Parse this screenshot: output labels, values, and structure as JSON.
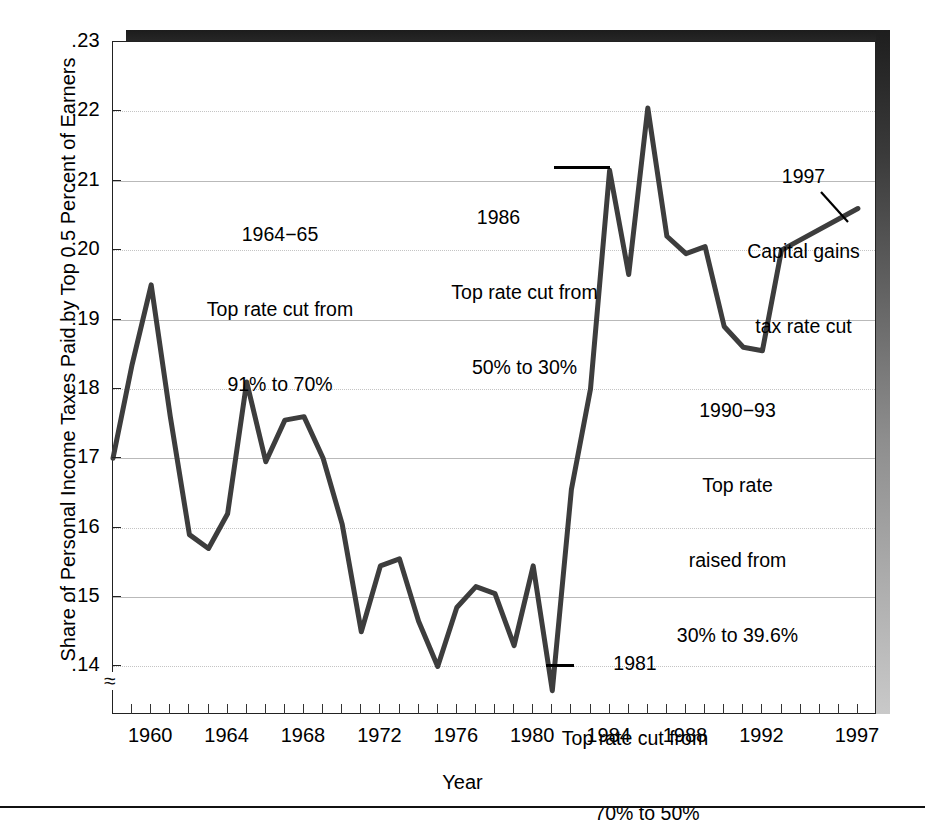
{
  "chart_data": {
    "type": "line",
    "title": "",
    "xlabel": "Year",
    "ylabel": "Share of Personal Income Taxes Paid by Top 0.5 Percent of Earners",
    "xlim": [
      1958,
      1998
    ],
    "ylim": [
      0.133,
      0.23
    ],
    "grid": true,
    "legend": "none",
    "y_ticks": [
      ".14",
      ".15",
      ".16",
      ".17",
      ".18",
      ".19",
      ".20",
      ".21",
      ".22",
      ".23"
    ],
    "y_tick_values": [
      0.14,
      0.15,
      0.16,
      0.17,
      0.18,
      0.19,
      0.2,
      0.21,
      0.22,
      0.23
    ],
    "x_ticks": [
      "1960",
      "1964",
      "1968",
      "1972",
      "1976",
      "1980",
      "1984",
      "1988",
      "1992",
      "1997"
    ],
    "x_tick_values": [
      1960,
      1964,
      1968,
      1972,
      1976,
      1980,
      1984,
      1988,
      1992,
      1997
    ],
    "axis_break_symbol": "≈",
    "series": [
      {
        "name": "Share of personal income taxes paid by top 0.5% of earners",
        "x": [
          1958,
          1959,
          1960,
          1961,
          1962,
          1963,
          1964,
          1965,
          1966,
          1967,
          1968,
          1969,
          1970,
          1971,
          1972,
          1973,
          1974,
          1975,
          1976,
          1977,
          1978,
          1979,
          1980,
          1981,
          1982,
          1983,
          1984,
          1985,
          1986,
          1987,
          1988,
          1989,
          1990,
          1991,
          1992,
          1993,
          1997
        ],
        "values": [
          0.17,
          0.1835,
          0.195,
          0.176,
          0.159,
          0.157,
          0.162,
          0.181,
          0.1695,
          0.1755,
          0.176,
          0.17,
          0.1605,
          0.145,
          0.1545,
          0.1555,
          0.1465,
          0.14,
          0.1485,
          0.1515,
          0.1505,
          0.143,
          0.1545,
          0.1365,
          0.1655,
          0.18,
          0.2115,
          0.1965,
          0.2205,
          0.202,
          0.1995,
          0.2005,
          0.189,
          0.186,
          0.1855,
          0.2,
          0.206
        ],
        "color": "#3d3d3d",
        "line_width": 5
      }
    ],
    "annotations": [
      {
        "id": "annot-1964-65",
        "lines": [
          "1964−65",
          "Top rate cut from",
          "91% to 70%"
        ]
      },
      {
        "id": "annot-1986",
        "lines": [
          "1986",
          "Top rate cut from",
          "50% to 30%"
        ],
        "leader": "horizontal"
      },
      {
        "id": "annot-1997",
        "lines": [
          "1997",
          "Capital gains",
          "tax rate cut"
        ],
        "leader": "diagonal"
      },
      {
        "id": "annot-1990-93",
        "lines": [
          "1990−93",
          "Top rate",
          "raised from",
          "30% to 39.6%"
        ]
      },
      {
        "id": "annot-1981",
        "lines": [
          "1981",
          "Top rate cut from",
          "70% to 50%"
        ],
        "leader": "horizontal"
      }
    ]
  },
  "axis": {
    "x_title": "Year",
    "y_title": "Share of Personal Income Taxes Paid by Top 0.5 Percent of Earners"
  },
  "annotation_text": {
    "a1964_l1": "1964−65",
    "a1964_l2": "Top rate cut from",
    "a1964_l3": "91% to 70%",
    "a1986_l1": "1986",
    "a1986_l2": "Top rate cut from",
    "a1986_l3": "50% to 30%",
    "a1997_l1": "1997",
    "a1997_l2": "Capital gains",
    "a1997_l3": "tax rate cut",
    "a1990_l1": "1990−93",
    "a1990_l2": "Top rate",
    "a1990_l3": "raised from",
    "a1990_l4": "30% to 39.6%",
    "a1981_l1": "1981",
    "a1981_l2": "Top rate cut from",
    "a1981_l3": "70% to 50%"
  },
  "marks": {
    "axis_break": "≈"
  }
}
